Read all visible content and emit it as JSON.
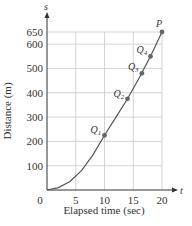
{
  "chart_data": {
    "type": "line",
    "title": "",
    "xlabel": "Elapsed time (sec)",
    "ylabel": "Distance (m)",
    "x_axis_symbol": "t",
    "y_axis_symbol": "s",
    "xlim": [
      0,
      20
    ],
    "ylim": [
      0,
      650
    ],
    "x_ticks": [
      0,
      5,
      10,
      15,
      20
    ],
    "y_ticks": [
      100,
      200,
      300,
      400,
      500,
      600,
      650
    ],
    "x_tick_labels": [
      "0",
      "5",
      "10",
      "15",
      "20"
    ],
    "y_tick_labels": [
      "100",
      "200",
      "300",
      "400",
      "500",
      "600",
      "650"
    ],
    "grid": true,
    "series": [
      {
        "name": "s(t)",
        "x": [
          0,
          2,
          4,
          6,
          8,
          10,
          12,
          14,
          16,
          18,
          20
        ],
        "values": [
          0,
          10,
          35,
          80,
          145,
          225,
          300,
          375,
          460,
          550,
          650
        ]
      }
    ],
    "points": [
      {
        "label": "Q1",
        "t": 10,
        "s": 225
      },
      {
        "label": "Q2",
        "t": 14,
        "s": 375
      },
      {
        "label": "Q3",
        "t": 16.5,
        "s": 480
      },
      {
        "label": "Q4",
        "t": 18,
        "s": 550
      },
      {
        "label": "P",
        "t": 20,
        "s": 650
      }
    ]
  }
}
